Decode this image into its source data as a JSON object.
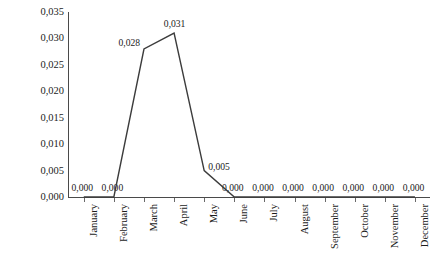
{
  "chart_data": {
    "type": "line",
    "title": "",
    "xlabel": "",
    "ylabel": "Flies  per Trap per Day- FTD",
    "categories": [
      "January",
      "February",
      "March",
      "April",
      "May",
      "June",
      "July",
      "August",
      "September",
      "October",
      "November",
      "December"
    ],
    "values": [
      0.0,
      0.0,
      0.028,
      0.031,
      0.005,
      0.0,
      0.0,
      0.0,
      0.0,
      0.0,
      0.0,
      0.0
    ],
    "point_labels": [
      "0,000",
      "0,000",
      "0,028",
      "0,031",
      "0,005",
      "0,000",
      "0,000",
      "0,000",
      "0,000",
      "0,000",
      "0,000",
      "0,000"
    ],
    "ylim": [
      0,
      0.035
    ],
    "y_tick_labels": [
      "0,035",
      "0,030",
      "0,025",
      "0,020",
      "0,015",
      "0,010",
      "0,005",
      "0,000"
    ],
    "y_tick_values": [
      0.035,
      0.03,
      0.025,
      0.02,
      0.015,
      0.01,
      0.005,
      0.0
    ],
    "decimal_separator": ",",
    "grid": false,
    "legend": false,
    "series_color": "#3c3c3c",
    "axis_color": "#4a4a4a",
    "text_color": "#1c1c1c",
    "markers": false,
    "data_labels_shown": true
  }
}
